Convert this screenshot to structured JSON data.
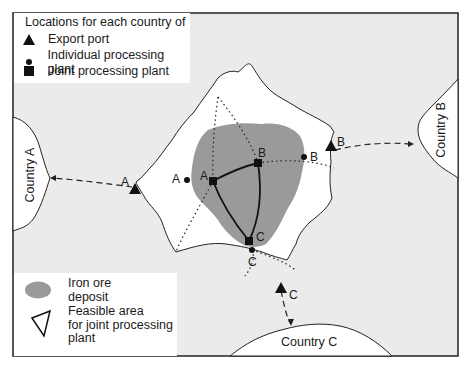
{
  "legend_locations": {
    "title": "Locations for each country of",
    "items": [
      {
        "symbol": "triangle",
        "label": "Export port"
      },
      {
        "symbol": "dot",
        "label": "Individual processing plant"
      },
      {
        "symbol": "square",
        "label": "Joint processing plant"
      }
    ]
  },
  "legend_areas": {
    "iron_ore": "Iron ore\ndeposit",
    "iron_ore_line1": "Iron ore",
    "iron_ore_line2": "deposit",
    "feasible_line1": "Feasible area",
    "feasible_line2": "for joint processing",
    "feasible_line3": "plant"
  },
  "countries": {
    "a": "Country A",
    "b": "Country B",
    "c": "Country C"
  },
  "point_labels": {
    "port_a": "A",
    "port_b": "B",
    "port_c": "C",
    "individual_a": "A",
    "individual_b": "B",
    "individual_c": "C",
    "joint_a": "A",
    "joint_b": "B",
    "joint_c": "C"
  },
  "colors": {
    "background": "#ebebeb",
    "land": "#ffffff",
    "ore": "#9a9a9a",
    "ink": "#1a1a1a"
  }
}
